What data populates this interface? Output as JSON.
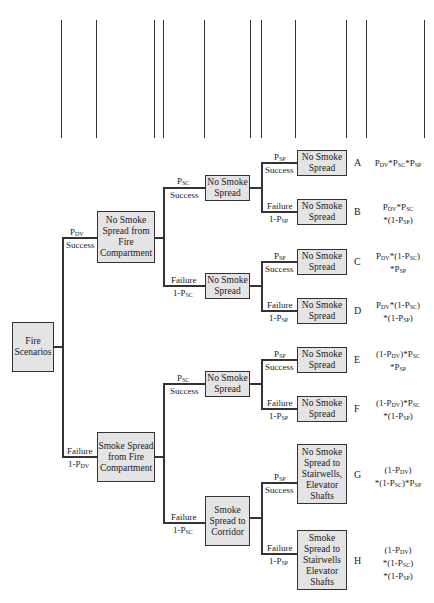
{
  "headers": [
    {
      "id": "door",
      "line1": "Door & Ventilation",
      "line2": "Closing Probability"
    },
    {
      "id": "cons1",
      "line1": "Consequence",
      "line2": ""
    },
    {
      "id": "fire_floor",
      "line1": "Fire Floor Smoke",
      "line2": "Control Probability"
    },
    {
      "id": "cons2",
      "line1": "Consequence",
      "line2": ""
    },
    {
      "id": "stairwell",
      "line1": "Stairwell & Elevator Shaft",
      "line2": "Pressurization Probability"
    },
    {
      "id": "cons3",
      "line1": "Consequence",
      "line2": ""
    },
    {
      "id": "scenario",
      "line1": "Scenario",
      "line2": ""
    },
    {
      "id": "scen_prob",
      "line1": "Senario",
      "line2": "Probability"
    }
  ],
  "root": {
    "label_l1": "Fire",
    "label_l2": "Scenarios"
  },
  "level1": [
    {
      "label": "No Smoke Spread from Fire Compartment",
      "branch_top": "P_DV",
      "branch_bottom": "Success"
    },
    {
      "label": "Smoke Spread from Fire Compartment",
      "branch_top": "Failure",
      "branch_bottom": "1-P_DV"
    }
  ],
  "level2": [
    {
      "label": "No Smoke Spread",
      "branch_top": "P_SC",
      "branch_bottom": "Success"
    },
    {
      "label": "No Smoke Spread",
      "branch_top": "Failure",
      "branch_bottom": "1-P_SC"
    },
    {
      "label": "No Smoke Spread",
      "branch_top": "P_SC",
      "branch_bottom": "Success"
    },
    {
      "label": "Smoke Spread to Corridor",
      "branch_top": "Failure",
      "branch_bottom": "1-P_SC"
    }
  ],
  "level3": [
    {
      "label": "No Smoke Spread",
      "branch_top": "P_SP",
      "branch_bottom": "Success",
      "scenario": "A",
      "prob": "P_DV*P_SC*P_SP"
    },
    {
      "label": "No Smoke Spread",
      "branch_top": "Failure",
      "branch_bottom": "1-P_SP",
      "scenario": "B",
      "prob": "P_DV*P_SC *(1-P_SP)"
    },
    {
      "label": "No Smoke Spread",
      "branch_top": "P_SP",
      "branch_bottom": "Success",
      "scenario": "C",
      "prob": "P_DV*(1-P_SC) *P_SP"
    },
    {
      "label": "No Smoke Spread",
      "branch_top": "Failure",
      "branch_bottom": "1-P_SP",
      "scenario": "D",
      "prob": "P_DV*(1-P_SC) *(1-P_SP)"
    },
    {
      "label": "No Smoke Spread",
      "branch_top": "P_SP",
      "branch_bottom": "Success",
      "scenario": "E",
      "prob": "(1-P_DV)*P_SC *P_SP"
    },
    {
      "label": "No Smoke Spread",
      "branch_top": "Failure",
      "branch_bottom": "1-P_SP",
      "scenario": "F",
      "prob": "(1-P_DV)*P_SC *(1-P_SP)"
    },
    {
      "label": "No Smoke Spread to Stairwells, Elevator Shafts",
      "branch_top": "P_SP",
      "branch_bottom": "Success",
      "scenario": "G",
      "prob": "(1-P_DV) *(1-P_SC)*P_SP"
    },
    {
      "label": "Smoke Spread to Stairwells Elevator Shafts",
      "branch_top": "Failure",
      "branch_bottom": "1-P_SP",
      "scenario": "H",
      "prob": "(1-P_DV) *(1-P_SC) *(1-P_SP)"
    }
  ],
  "colors": {
    "box_fill": "#e4e4e4",
    "line": "#333333"
  }
}
